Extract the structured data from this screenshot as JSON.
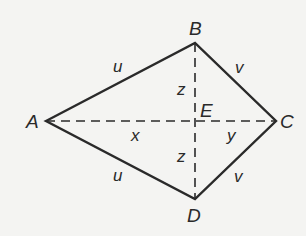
{
  "diagram": {
    "type": "kite",
    "vertices": {
      "A": {
        "label": "A",
        "x": 46,
        "y": 121
      },
      "B": {
        "label": "B",
        "x": 195,
        "y": 43
      },
      "C": {
        "label": "C",
        "x": 276,
        "y": 121
      },
      "D": {
        "label": "D",
        "x": 195,
        "y": 199
      },
      "E": {
        "label": "E",
        "x": 195,
        "y": 121
      }
    },
    "sides": {
      "AB": "u",
      "AD": "u",
      "BC": "v",
      "DC": "v"
    },
    "segments": {
      "AE": "x",
      "EC": "y",
      "BE": "z",
      "ED": "z"
    },
    "colors": {
      "stroke": "#2a2a2a",
      "background": "#f4f4f2"
    }
  }
}
